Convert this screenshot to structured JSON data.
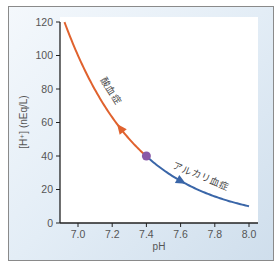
{
  "chart_data": {
    "type": "line",
    "title": "",
    "xlabel": "pH",
    "ylabel": "[H⁺] (nEq/L)",
    "xlim": [
      6.92,
      8.0
    ],
    "ylim": [
      0,
      120
    ],
    "xticks": [
      "7.0",
      "7.2",
      "7.4",
      "7.6",
      "7.8",
      "8.0"
    ],
    "yticks": [
      "0",
      "20",
      "40",
      "60",
      "80",
      "100",
      "120"
    ],
    "grid": false,
    "series": [
      {
        "name": "酸血症",
        "color": "#e0622e",
        "x": [
          6.92,
          7.0,
          7.1,
          7.2,
          7.3,
          7.4
        ],
        "y": [
          120,
          100,
          79,
          63,
          50,
          40
        ]
      },
      {
        "name": "アルカリ血症",
        "color": "#3a66a8",
        "x": [
          7.4,
          7.5,
          7.6,
          7.7,
          7.8,
          7.9,
          8.0
        ],
        "y": [
          40,
          32,
          25,
          20,
          16,
          13,
          10
        ]
      }
    ],
    "annotations": [
      {
        "text": "酸血症",
        "near": {
          "x": 7.2,
          "y": 80
        }
      },
      {
        "text": "アルカリ血症",
        "near": {
          "x": 7.65,
          "y": 32
        }
      },
      {
        "text": "normal point",
        "x": 7.4,
        "y": 40,
        "marker": "circle",
        "color": "#8a5aa8"
      }
    ]
  },
  "labels": {
    "acidemia": "酸血症",
    "alkalemia": "アルカリ血症",
    "xlabel": "pH",
    "ylabel": "[H⁺] (nEq/L)"
  }
}
